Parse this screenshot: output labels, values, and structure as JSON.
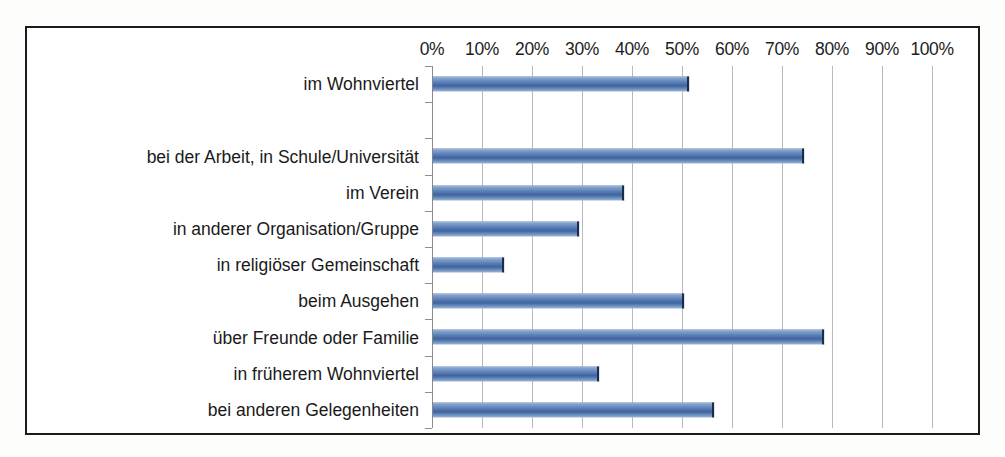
{
  "chart_data": {
    "type": "bar",
    "orientation": "horizontal",
    "title": "",
    "xlabel": "",
    "ylabel": "",
    "xlim": [
      0,
      100
    ],
    "xtick_step": 10,
    "grid": true,
    "legend": false,
    "value_unit": "%",
    "series_color": "#4e73ae",
    "categories": [
      "im Wohnviertel",
      "",
      "bei der Arbeit, in Schule/Universität",
      "im Verein",
      "in anderer Organisation/Gruppe",
      "in religiöser Gemeinschaft",
      "beim Ausgehen",
      "über Freunde oder Familie",
      "in früherem Wohnviertel",
      "bei anderen Gelegenheiten"
    ],
    "values": [
      51,
      null,
      74,
      38,
      29,
      14,
      50,
      78,
      33,
      56
    ],
    "xticklabels": [
      "0%",
      "10%",
      "20%",
      "30%",
      "40%",
      "50%",
      "60%",
      "70%",
      "80%",
      "90%",
      "100%"
    ],
    "xticks": [
      0,
      10,
      20,
      30,
      40,
      50,
      60,
      70,
      80,
      90,
      100
    ]
  },
  "frame": {
    "border_color": "#1b1b1b",
    "background": "#ffffff"
  }
}
